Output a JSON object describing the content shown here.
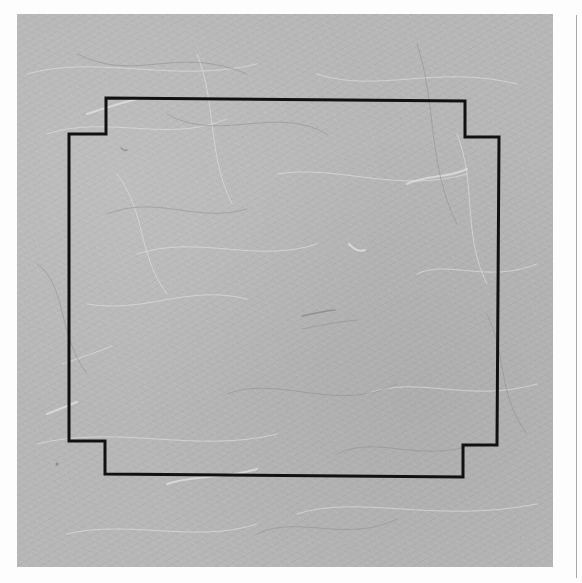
{
  "image": {
    "description": "Scanned sheet of textured mulberry paper with a black stepped-corner rectangular outline drawn on it",
    "width": 582,
    "height": 583
  },
  "colors": {
    "background": "#fdfdfd",
    "paper": "#b6b6b6",
    "fiber_light": "#dcdcdc",
    "fiber_dark": "#8e8e8e",
    "outline": "#111111",
    "edge_line": "#a8a8a8"
  },
  "paper": {
    "left": 17,
    "top": 14,
    "right": 553,
    "bottom": 567
  },
  "outline": {
    "stroke_width": 3,
    "points": [
      [
        106,
        98
      ],
      [
        465,
        101
      ],
      [
        465,
        137
      ],
      [
        499,
        137
      ],
      [
        497,
        445
      ],
      [
        463,
        445
      ],
      [
        463,
        477
      ],
      [
        105,
        474
      ],
      [
        105,
        441
      ],
      [
        69,
        441
      ],
      [
        69,
        134
      ],
      [
        106,
        134
      ]
    ]
  },
  "edge_line": {
    "x": 576,
    "top": 15,
    "bottom": 578
  }
}
